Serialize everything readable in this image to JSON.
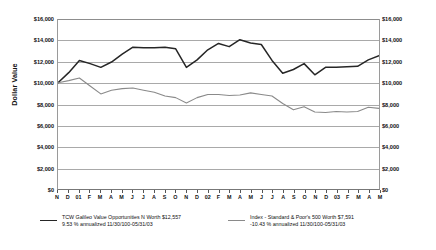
{
  "chart_data": {
    "type": "line",
    "title": "",
    "xlabel": "",
    "ylabel": "Dollar Value",
    "ylim": [
      0,
      16000
    ],
    "yticks": [
      "$0",
      "$2,000",
      "$4,000",
      "$6,000",
      "$8,000",
      "$10,000",
      "$12,000",
      "$14,000",
      "$16,000"
    ],
    "ytick_values": [
      0,
      2000,
      4000,
      6000,
      8000,
      10000,
      12000,
      14000,
      16000
    ],
    "grid": true,
    "dual_y_axis": true,
    "legend_position": "bottom",
    "categories": [
      "N",
      "D",
      "01",
      "F",
      "M",
      "A",
      "M",
      "J",
      "J",
      "A",
      "S",
      "O",
      "N",
      "D",
      "02",
      "F",
      "M",
      "A",
      "M",
      "J",
      "J",
      "A",
      "S",
      "O",
      "N",
      "D",
      "03",
      "F",
      "M",
      "A",
      "M"
    ],
    "series": [
      {
        "name": "TCW Galileo Value Opportunities N",
        "color": "#262626",
        "final_value": 12557,
        "values": [
          10000,
          10950,
          12100,
          11800,
          11450,
          11950,
          12700,
          13350,
          13300,
          13300,
          13350,
          13200,
          11450,
          12150,
          13100,
          13700,
          13400,
          14050,
          13750,
          13600,
          12100,
          10900,
          11250,
          11800,
          10750,
          11450,
          11450,
          11500,
          11550,
          12150,
          12557
        ]
      },
      {
        "name": "Index - Standard & Poor's 500",
        "color": "#8a8a8a",
        "final_value": 7591,
        "values": [
          10000,
          10200,
          10450,
          9700,
          8950,
          9300,
          9450,
          9500,
          9300,
          9100,
          8750,
          8600,
          8100,
          8600,
          8900,
          8900,
          8800,
          8850,
          9050,
          8900,
          8750,
          8050,
          7450,
          7750,
          7250,
          7200,
          7300,
          7250,
          7300,
          7700,
          7591
        ]
      }
    ]
  },
  "axis": {
    "y_title": "Dollar Value"
  },
  "legend": {
    "entries": [
      {
        "swatch": "legend-swatch-galileo",
        "line1": "TCW Galileo Value Opportunities N Worth $12,557",
        "line2": "9.53 % annualized 11/30/100-05/31/03",
        "color": "#262626"
      },
      {
        "swatch": "legend-swatch-sp500",
        "line1": "Index - Standard & Poor's 500 Worth $7,591",
        "line2": "-10.43 % annualized 11/30/100-05/31/03",
        "color": "#8a8a8a"
      }
    ]
  }
}
